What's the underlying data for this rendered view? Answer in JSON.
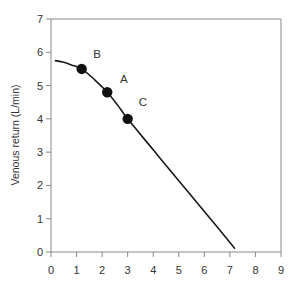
{
  "chart_data": {
    "type": "line",
    "title": "",
    "xlabel": "",
    "ylabel": "Venous return (L/min)",
    "xlim": [
      0,
      9
    ],
    "ylim": [
      0,
      7
    ],
    "x_ticks": [
      0,
      1,
      2,
      3,
      4,
      5,
      6,
      7,
      8,
      9
    ],
    "y_ticks": [
      0,
      1,
      2,
      3,
      4,
      5,
      6,
      7
    ],
    "x_tick_labels": [
      "0",
      "1",
      "2",
      "3",
      "4",
      "5",
      "6",
      "7",
      "8",
      "9"
    ],
    "y_tick_labels": [
      "0",
      "1",
      "2",
      "3",
      "4",
      "5",
      "6",
      "7"
    ],
    "grid": false,
    "legend": "none",
    "series": [
      {
        "name": "Venous return curve",
        "color": "#1a1a1a",
        "x": [
          0.15,
          0.5,
          0.8,
          1.2,
          1.7,
          2.2,
          2.6,
          3.0,
          4.0,
          5.0,
          6.0,
          7.2
        ],
        "y": [
          5.75,
          5.7,
          5.62,
          5.5,
          5.18,
          4.8,
          4.42,
          4.0,
          3.07,
          2.14,
          1.22,
          0.1
        ]
      }
    ],
    "points": [
      {
        "label": "B",
        "x": 1.2,
        "y": 5.5,
        "label_x": 1.8,
        "label_y": 5.95
      },
      {
        "label": "A",
        "x": 2.2,
        "y": 4.8,
        "label_x": 2.85,
        "label_y": 5.2
      },
      {
        "label": "C",
        "x": 3.0,
        "y": 4.0,
        "label_x": 3.6,
        "label_y": 4.5
      }
    ],
    "axis_color": "#888888",
    "frame": "open-right-partial"
  }
}
